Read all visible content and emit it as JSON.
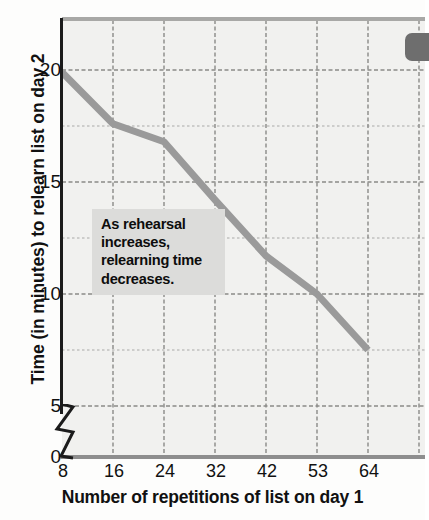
{
  "chart_data": {
    "type": "line",
    "title": "",
    "xlabel": "Number of repetitions of list on day 1",
    "ylabel": "Time (in minutes) to relearn list on day 2",
    "categories": [
      "8",
      "16",
      "24",
      "32",
      "42",
      "53",
      "64"
    ],
    "values": [
      19.9,
      17.6,
      16.8,
      14.2,
      11.7,
      10.0,
      7.5
    ],
    "series": [
      {
        "name": "Relearning time",
        "values": [
          19.9,
          17.6,
          16.8,
          14.2,
          11.7,
          10.0,
          7.5
        ]
      }
    ],
    "ylim": [
      0,
      22.5
    ],
    "yticks": [
      "0",
      "5",
      "10",
      "15",
      "20"
    ],
    "ytick_values": [
      0,
      5,
      10,
      15,
      20
    ],
    "xticks": [
      "8",
      "16",
      "24",
      "32",
      "42",
      "53",
      "64"
    ],
    "grid": true,
    "axis_break": true,
    "axis_break_between": [
      0,
      5
    ],
    "legend": "none",
    "line_color": "#9a9a9a",
    "plot_background": "#f1f1ef",
    "gridline_color": "#8f8f8f"
  },
  "annotation": {
    "line1": "As rehearsal",
    "line2": "increases,",
    "line3": "relearning time",
    "line4": "decreases.",
    "background": "#dcdcda"
  },
  "axes": {
    "y_title": "Time (in minutes) to relearn list on day 2",
    "x_title": "Number of repetitions of list on day 1",
    "y_labels": [
      "20",
      "15",
      "10",
      "5",
      "0"
    ],
    "x_labels": [
      "8",
      "16",
      "24",
      "32",
      "42",
      "53",
      "64"
    ]
  },
  "artifact": {
    "name": "page-edge-mark",
    "color": "#6e6e6e"
  }
}
